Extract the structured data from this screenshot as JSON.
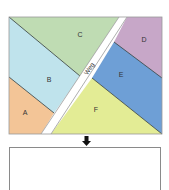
{
  "diagram": {
    "regions": [
      {
        "id": "A",
        "label": "A",
        "color": "#f3c597"
      },
      {
        "id": "B",
        "label": "B",
        "color": "#bfe3ec"
      },
      {
        "id": "C",
        "label": "C",
        "color": "#bfdcb3"
      },
      {
        "id": "D",
        "label": "D",
        "color": "#c7a7c8"
      },
      {
        "id": "E",
        "label": "E",
        "color": "#6e9fd6"
      },
      {
        "id": "F",
        "label": "F",
        "color": "#e3ec95"
      }
    ],
    "road": {
      "label": "Weg",
      "color": "#ffffff"
    },
    "arrow": {
      "direction": "down",
      "color": "#111111"
    },
    "answer_box": {
      "content": ""
    }
  }
}
